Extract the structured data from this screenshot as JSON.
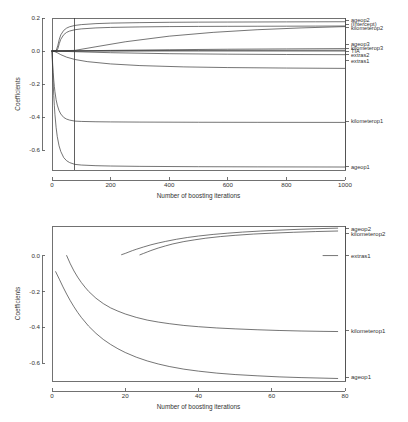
{
  "page": {
    "background": "#ffffff",
    "line_color": "#3a3a3a",
    "axis_color": "#4d4d4d",
    "text_color": "#333333"
  },
  "chart_data": [
    {
      "id": "top",
      "type": "line",
      "title": "",
      "xlabel": "Number of boosting iterations",
      "ylabel": "Coefficients",
      "xlim": [
        0,
        1000
      ],
      "ylim": [
        -0.72,
        0.2
      ],
      "xticks": [
        0,
        200,
        400,
        600,
        800,
        1000
      ],
      "yticks": [
        0.2,
        0.0,
        -0.2,
        -0.4,
        -0.6
      ],
      "xticklabels": [
        "0",
        "200",
        "400",
        "600",
        "800",
        "1000"
      ],
      "yticklabels": [
        "0.2",
        "0.0",
        "-0.2",
        "-0.4",
        "-0.6"
      ],
      "grid": false,
      "legend": "right-axis-labels",
      "annotations": [
        {
          "type": "vline",
          "x": 78,
          "label": "selected mstop"
        }
      ],
      "series": [
        {
          "name": "ageop2",
          "label": "ageop2",
          "label_y": 0.186,
          "x": [
            0,
            5,
            10,
            15,
            20,
            25,
            30,
            40,
            50,
            60,
            78,
            100,
            150,
            200,
            300,
            400,
            500,
            600,
            700,
            800,
            900,
            1000
          ],
          "values": [
            0.0,
            0.0,
            0.0,
            0.006,
            0.035,
            0.072,
            0.098,
            0.125,
            0.139,
            0.147,
            0.155,
            0.16,
            0.166,
            0.169,
            0.172,
            0.174,
            0.175,
            0.1755,
            0.176,
            0.1765,
            0.177,
            0.1775
          ]
        },
        {
          "name": "(Intercept)",
          "label": "(Intercept)",
          "label_y": 0.163,
          "x": [
            0,
            1000
          ],
          "values": [
            0.0,
            0.0
          ]
        },
        {
          "name": "kilometerop2",
          "label": "kilometerop2",
          "label_y": 0.14,
          "x": [
            0,
            5,
            10,
            15,
            20,
            25,
            30,
            40,
            50,
            60,
            78,
            100,
            150,
            200,
            300,
            400,
            500,
            600,
            700,
            800,
            900,
            1000
          ],
          "values": [
            0.0,
            0.0,
            0.0,
            0.0,
            0.014,
            0.046,
            0.071,
            0.099,
            0.113,
            0.121,
            0.129,
            0.134,
            0.14,
            0.143,
            0.146,
            0.148,
            0.149,
            0.1495,
            0.15,
            0.1505,
            0.151,
            0.1515
          ]
        },
        {
          "name": "ageop3",
          "label": "ageop3",
          "label_y": 0.04,
          "x": [
            0,
            78,
            150,
            250,
            400,
            550,
            700,
            850,
            1000
          ],
          "values": [
            0.0,
            0.004,
            0.026,
            0.056,
            0.09,
            0.113,
            0.129,
            0.14,
            0.148
          ]
        },
        {
          "name": "kilometerop3",
          "label": "kilometerop3",
          "label_y": 0.016,
          "x": [
            0,
            78,
            200,
            400,
            600,
            800,
            1000
          ],
          "values": [
            0.0,
            0.001,
            0.004,
            0.008,
            0.011,
            0.013,
            0.015
          ]
        },
        {
          "name": "TIA",
          "label": "TIA",
          "label_y": 0.0,
          "x": [
            0,
            200,
            500,
            1000
          ],
          "values": [
            0.0,
            0.002,
            0.004,
            0.005
          ]
        },
        {
          "name": "extras2",
          "label": "extras2",
          "label_y": -0.022,
          "x": [
            0,
            78,
            200,
            400,
            600,
            800,
            1000
          ],
          "values": [
            0.0,
            -0.004,
            -0.01,
            -0.016,
            -0.019,
            -0.021,
            -0.022
          ]
        },
        {
          "name": "extras1",
          "label": "extras1",
          "label_y": -0.058,
          "x": [
            0,
            10,
            20,
            30,
            50,
            78,
            120,
            200,
            300,
            450,
            600,
            800,
            1000
          ],
          "values": [
            0.0,
            -0.004,
            -0.012,
            -0.022,
            -0.037,
            -0.051,
            -0.064,
            -0.078,
            -0.088,
            -0.096,
            -0.1,
            -0.103,
            -0.105
          ]
        },
        {
          "name": "kilometerop1",
          "label": "kilometerop1",
          "label_y": -0.425,
          "x": [
            0,
            2,
            4,
            6,
            8,
            10,
            14,
            18,
            24,
            30,
            40,
            50,
            60,
            78,
            100,
            150,
            200,
            300,
            500,
            700,
            1000
          ],
          "values": [
            0.0,
            -0.07,
            -0.128,
            -0.176,
            -0.214,
            -0.246,
            -0.294,
            -0.327,
            -0.36,
            -0.381,
            -0.402,
            -0.412,
            -0.418,
            -0.424,
            -0.426,
            -0.428,
            -0.429,
            -0.43,
            -0.431,
            -0.4315,
            -0.432
          ]
        },
        {
          "name": "ageop1",
          "label": "ageop1",
          "label_y": -0.7,
          "x": [
            0,
            2,
            4,
            6,
            8,
            10,
            14,
            18,
            24,
            30,
            40,
            50,
            60,
            78,
            100,
            150,
            200,
            300,
            500,
            700,
            1000
          ],
          "values": [
            0.0,
            -0.1,
            -0.192,
            -0.268,
            -0.33,
            -0.383,
            -0.462,
            -0.518,
            -0.573,
            -0.608,
            -0.645,
            -0.664,
            -0.675,
            -0.686,
            -0.69,
            -0.694,
            -0.696,
            -0.698,
            -0.7,
            -0.701,
            -0.702
          ]
        }
      ]
    },
    {
      "id": "bottom",
      "type": "line",
      "title": "",
      "xlabel": "Number of boosting iterations",
      "ylabel": "Coefficients",
      "xlim": [
        0,
        80
      ],
      "ylim": [
        -0.7,
        0.165
      ],
      "xticks": [
        0,
        20,
        40,
        60,
        80
      ],
      "yticks": [
        0.0,
        -0.2,
        -0.4,
        -0.6
      ],
      "xticklabels": [
        "0",
        "20",
        "40",
        "60",
        "80"
      ],
      "yticklabels": [
        "0.0",
        "-0.2",
        "-0.4",
        "-0.6"
      ],
      "grid": false,
      "legend": "right-axis-labels",
      "annotations": [],
      "series": [
        {
          "name": "ageop2",
          "label": "ageop2",
          "label_y": 0.15,
          "x": [
            19,
            20,
            21,
            22,
            23,
            25,
            27,
            29,
            31,
            34,
            37,
            40,
            44,
            48,
            52,
            57,
            62,
            68,
            74,
            78
          ],
          "values": [
            0.005,
            0.012,
            0.02,
            0.028,
            0.035,
            0.048,
            0.06,
            0.07,
            0.079,
            0.091,
            0.101,
            0.109,
            0.118,
            0.125,
            0.131,
            0.137,
            0.142,
            0.147,
            0.151,
            0.153
          ]
        },
        {
          "name": "kilometerop2",
          "label": "kilometerop2",
          "label_y": 0.122,
          "x": [
            24,
            25,
            26,
            27,
            29,
            31,
            33,
            36,
            39,
            42,
            46,
            50,
            55,
            60,
            66,
            72,
            78
          ],
          "values": [
            0.004,
            0.012,
            0.02,
            0.028,
            0.042,
            0.054,
            0.065,
            0.078,
            0.088,
            0.097,
            0.106,
            0.113,
            0.12,
            0.125,
            0.13,
            0.134,
            0.137
          ]
        },
        {
          "name": "extras1",
          "label": "extras1",
          "label_y": 0.0,
          "x": [
            74,
            78
          ],
          "values": [
            0.0,
            0.0
          ]
        },
        {
          "name": "kilometerop1",
          "label": "kilometerop1",
          "label_y": -0.42,
          "x": [
            4,
            5,
            6,
            7,
            8,
            9,
            10,
            12,
            14,
            16,
            18,
            20,
            23,
            26,
            29,
            32,
            36,
            40,
            45,
            50,
            56,
            62,
            68,
            74,
            78
          ],
          "values": [
            0.0,
            -0.046,
            -0.086,
            -0.12,
            -0.15,
            -0.176,
            -0.2,
            -0.238,
            -0.268,
            -0.292,
            -0.31,
            -0.326,
            -0.345,
            -0.36,
            -0.371,
            -0.38,
            -0.39,
            -0.397,
            -0.404,
            -0.409,
            -0.414,
            -0.418,
            -0.421,
            -0.423,
            -0.424
          ]
        },
        {
          "name": "ageop1",
          "label": "ageop1",
          "label_y": -0.68,
          "x": [
            1,
            2,
            3,
            4,
            5,
            6,
            7,
            8,
            10,
            12,
            14,
            16,
            18,
            20,
            23,
            26,
            29,
            32,
            36,
            40,
            45,
            50,
            56,
            62,
            68,
            74,
            78
          ],
          "values": [
            -0.09,
            -0.132,
            -0.175,
            -0.215,
            -0.252,
            -0.286,
            -0.317,
            -0.345,
            -0.394,
            -0.434,
            -0.468,
            -0.496,
            -0.52,
            -0.541,
            -0.567,
            -0.588,
            -0.605,
            -0.619,
            -0.634,
            -0.645,
            -0.656,
            -0.664,
            -0.671,
            -0.677,
            -0.681,
            -0.684,
            -0.686
          ]
        }
      ]
    }
  ]
}
